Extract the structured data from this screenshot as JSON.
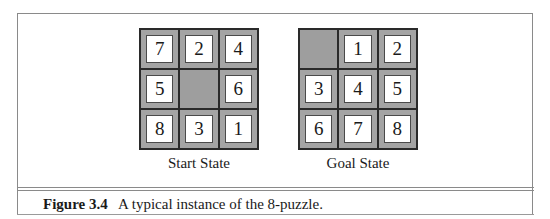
{
  "figure": {
    "number_label": "Figure 3.4",
    "caption": "A typical instance of the 8-puzzle."
  },
  "boards": [
    {
      "label": "Start State",
      "cells": [
        "7",
        "2",
        "4",
        "5",
        "",
        "6",
        "8",
        "3",
        "1"
      ]
    },
    {
      "label": "Goal State",
      "cells": [
        "",
        "1",
        "2",
        "3",
        "4",
        "5",
        "6",
        "7",
        "8"
      ]
    }
  ],
  "colors": {
    "tile_face": "#ffffff",
    "tile_frame": "#a4a4a4",
    "blank_cell": "#9e9e9e",
    "grid_line": "#2a2a2a"
  }
}
